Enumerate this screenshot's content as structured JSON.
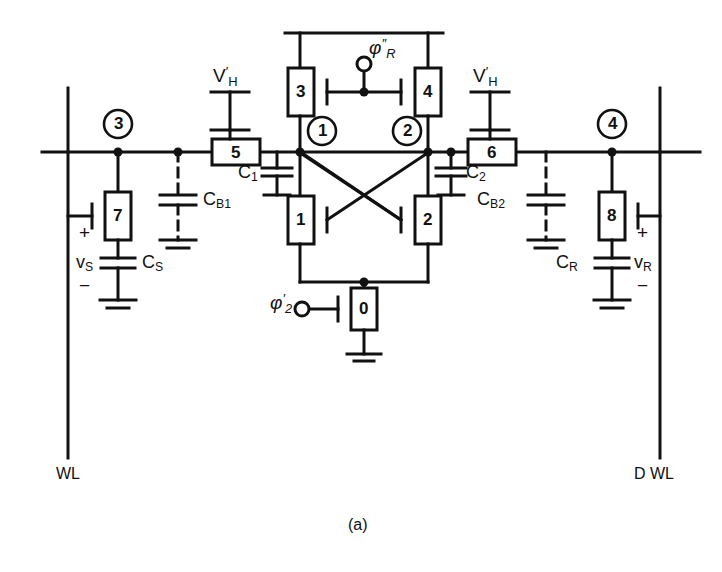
{
  "figure": {
    "caption": "(a)",
    "type": "circuit-schematic"
  },
  "rails": {
    "left_bitline_label": "WL",
    "right_bitline_label": "D WL"
  },
  "supplies": [
    {
      "id": "vh-left",
      "label_base": "V",
      "label_sup": "'",
      "label_sub": "H",
      "text": "V'H"
    },
    {
      "id": "vh-right",
      "label_base": "V",
      "label_sup": "'",
      "label_sub": "H",
      "text": "V'H"
    }
  ],
  "clocks": [
    {
      "id": "phi-r",
      "base": "φ",
      "sup": "″",
      "sub": "R",
      "text": "φ″R"
    },
    {
      "id": "phi-2",
      "base": "φ",
      "sup": "′",
      "sub": "2",
      "text": "φ′2"
    }
  ],
  "transistors": [
    {
      "id": "t0",
      "label": "0",
      "role": "tail-switch"
    },
    {
      "id": "t1",
      "label": "1",
      "role": "cross-coupled-left"
    },
    {
      "id": "t2",
      "label": "2",
      "role": "cross-coupled-right"
    },
    {
      "id": "t3",
      "label": "3",
      "role": "precharge-left"
    },
    {
      "id": "t4",
      "label": "4",
      "role": "precharge-right"
    },
    {
      "id": "t5",
      "label": "5",
      "role": "isolation-left"
    },
    {
      "id": "t6",
      "label": "6",
      "role": "isolation-right"
    },
    {
      "id": "t7",
      "label": "7",
      "role": "storage-cell-access"
    },
    {
      "id": "t8",
      "label": "8",
      "role": "dummy-cell-access"
    }
  ],
  "nodes": [
    {
      "id": "n1",
      "label": "1"
    },
    {
      "id": "n2",
      "label": "2"
    },
    {
      "id": "n3",
      "label": "3"
    },
    {
      "id": "n4",
      "label": "4"
    }
  ],
  "capacitors": [
    {
      "id": "c1",
      "base": "C",
      "sub": "1",
      "text": "C1",
      "style": "solid"
    },
    {
      "id": "c2",
      "base": "C",
      "sub": "2",
      "text": "C2",
      "style": "solid"
    },
    {
      "id": "cb1",
      "base": "C",
      "sub": "B1",
      "text": "CB1",
      "style": "dashed"
    },
    {
      "id": "cb2",
      "base": "C",
      "sub": "B2",
      "text": "CB2",
      "style": "dashed"
    },
    {
      "id": "cs",
      "base": "C",
      "sub": "S",
      "text": "CS",
      "style": "solid"
    },
    {
      "id": "cr",
      "base": "C",
      "sub": "R",
      "text": "CR",
      "style": "solid"
    }
  ],
  "voltages": [
    {
      "id": "vs",
      "base": "v",
      "sub": "S",
      "text": "vS",
      "plus": "+",
      "minus": "−"
    },
    {
      "id": "vr",
      "base": "v",
      "sub": "R",
      "text": "vR",
      "plus": "+",
      "minus": "−"
    }
  ],
  "colors": {
    "ink": "#111111",
    "background": "#ffffff"
  }
}
